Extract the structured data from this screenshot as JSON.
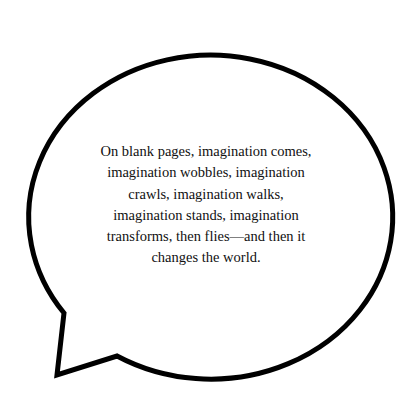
{
  "speech_bubble": {
    "text": "On blank pages, imagination comes, imagination wobbles, imagination crawls, imagination walks, imagination stands, imagination transforms, then flies—and then it changes the world.",
    "stroke_color": "#000000",
    "fill_color": "#ffffff"
  }
}
